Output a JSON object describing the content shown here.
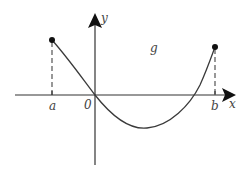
{
  "diagram": {
    "type": "function-graph",
    "labels": {
      "y_axis": "y",
      "x_axis": "x",
      "function": "g",
      "left_endpoint": "a",
      "right_endpoint": "b",
      "origin": "0"
    },
    "colors": {
      "axis": "#222222",
      "curve": "#3a3a3a",
      "dashed": "#444444",
      "label": "#444444"
    }
  }
}
